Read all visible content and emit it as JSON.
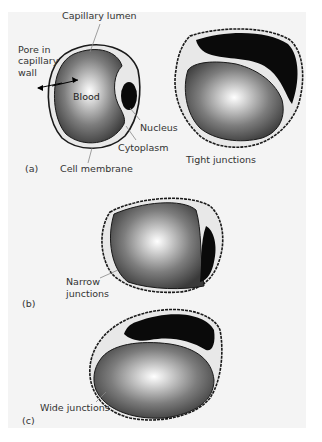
{
  "figure": {
    "panels": [
      {
        "id": "a",
        "label": "(a)",
        "annotations": {
          "capillary_lumen": "Capillary lumen",
          "pore": "Pore in\ncapillary\nwall",
          "pore_lines": [
            "Pore in",
            "capillary",
            "wall"
          ],
          "blood": "Blood",
          "nucleus": "Nucleus",
          "cytoplasm": "Cytoplasm",
          "cell_membrane": "Cell membrane",
          "tight_junctions": "Tight junctions"
        }
      },
      {
        "id": "b",
        "label": "(b)",
        "annotations": {
          "junctions_lines": [
            "Narrow",
            "junctions"
          ]
        }
      },
      {
        "id": "c",
        "label": "(c)",
        "annotations": {
          "wide_junctions": "Wide junctions"
        }
      }
    ],
    "colors": {
      "panel_bg": "#f4f4f4",
      "outline": "#1a1a1a",
      "nucleus": "#0a0a0a",
      "cytoplasm": "#e8e8e8",
      "lumen_center": "#ffffff",
      "lumen_edge": "#3a3a3a"
    }
  }
}
